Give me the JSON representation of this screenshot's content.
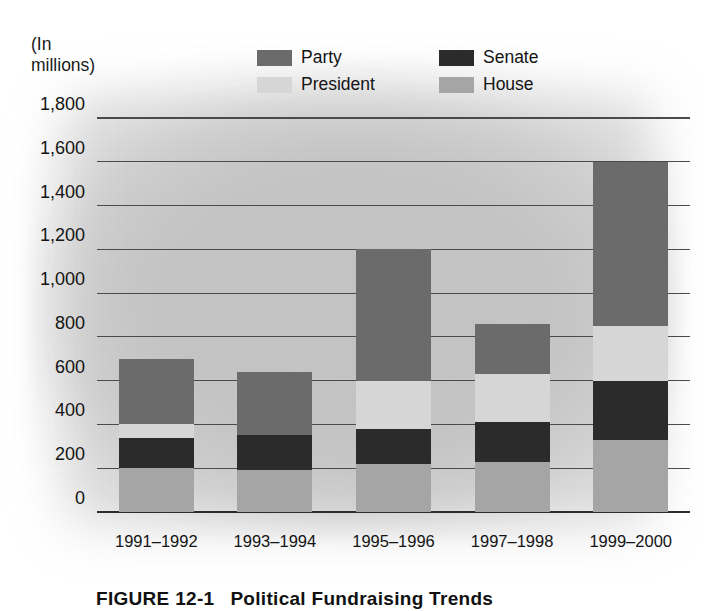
{
  "units_note": "(In\nmillions)",
  "caption": {
    "figure_number": "FIGURE 12-1",
    "figure_title": "Political Fundraising Trends"
  },
  "legend": {
    "items": [
      {
        "label": "Party",
        "color": "#6b6b6b"
      },
      {
        "label": "Senate",
        "color": "#2b2b2b"
      },
      {
        "label": "President",
        "color": "#d6d6d6"
      },
      {
        "label": "House",
        "color": "#a5a5a5"
      }
    ]
  },
  "colors": {
    "party": "#6b6b6b",
    "senate": "#2b2b2b",
    "president": "#d6d6d6",
    "house": "#a5a5a5",
    "gridline": "#4a4a4a",
    "text": "#141414",
    "background": "#ffffff"
  },
  "chart_data": {
    "type": "bar",
    "stacked": true,
    "title": "Political Fundraising Trends",
    "xlabel": "",
    "ylabel": "(In millions)",
    "ylim": [
      0,
      1800
    ],
    "ytick_step": 200,
    "ytick_labels": [
      "0",
      "200",
      "400",
      "600",
      "800",
      "1,000",
      "1,200",
      "1,400",
      "1,600",
      "1,800"
    ],
    "ytick_values": [
      0,
      200,
      400,
      600,
      800,
      1000,
      1200,
      1400,
      1600,
      1800
    ],
    "grid": true,
    "legend_position": "top",
    "categories": [
      "1991–1992",
      "1993–1994",
      "1995–1996",
      "1997–1998",
      "1999–2000"
    ],
    "stack_order_bottom_to_top": [
      "House",
      "Senate",
      "President",
      "Party"
    ],
    "series": [
      {
        "name": "House",
        "color": "#a5a5a5",
        "values": [
          200,
          190,
          220,
          230,
          330
        ]
      },
      {
        "name": "Senate",
        "color": "#2b2b2b",
        "values": [
          140,
          160,
          160,
          180,
          270
        ]
      },
      {
        "name": "President",
        "color": "#d6d6d6",
        "values": [
          60,
          0,
          220,
          220,
          250
        ]
      },
      {
        "name": "Party",
        "color": "#6b6b6b",
        "values": [
          300,
          290,
          600,
          230,
          750
        ]
      }
    ],
    "totals": [
      700,
      640,
      1200,
      860,
      1600
    ]
  }
}
